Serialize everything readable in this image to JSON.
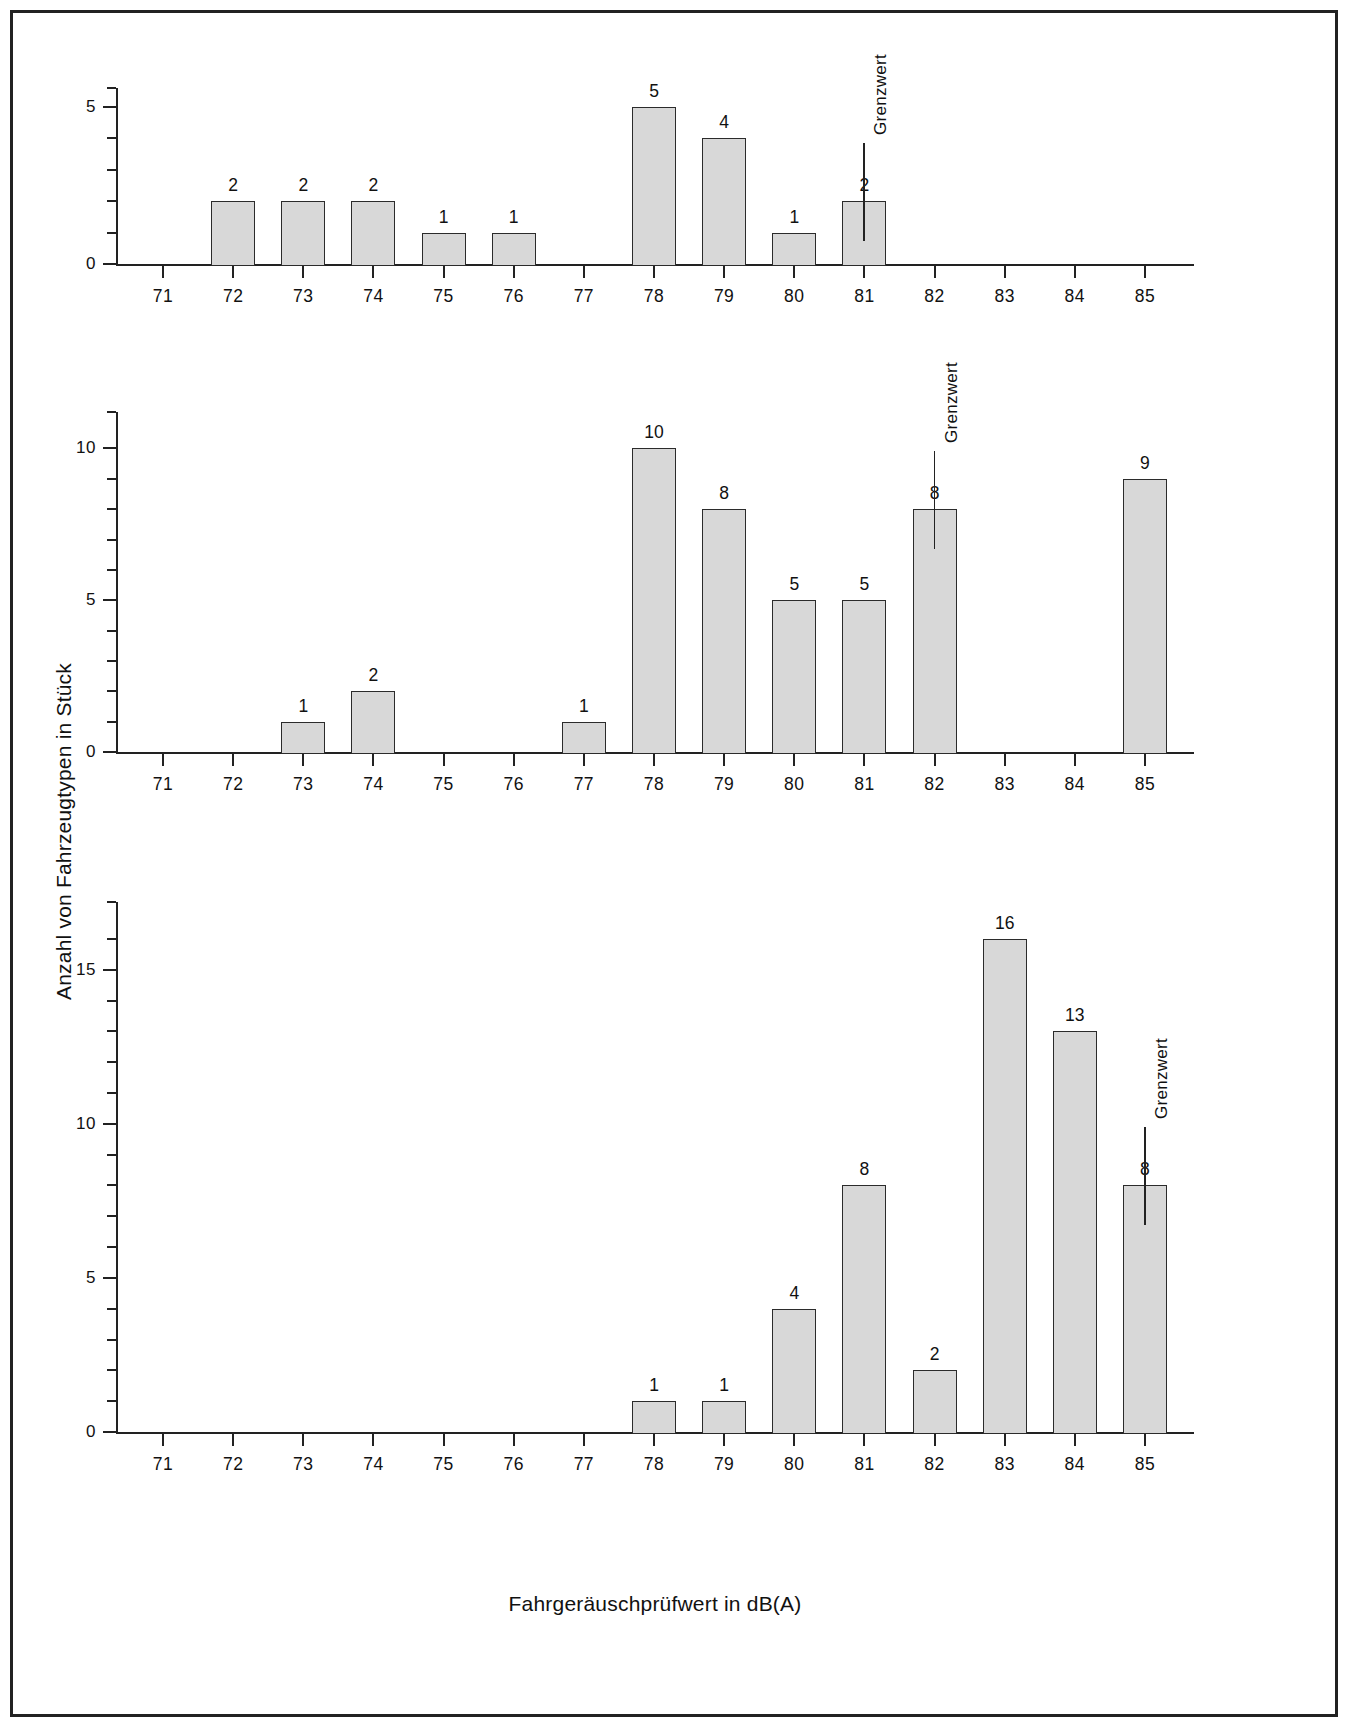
{
  "axis_titles": {
    "y": "Anzahl von Fahrzeugtypen in Stück",
    "x": "Fahrgeräuschprüfwert in dB(A)"
  },
  "colors": {
    "bar_fill": "#d8d8d8",
    "bar_stroke": "#2b2b2b",
    "axis": "#222222",
    "page_bg": "#ffffff"
  },
  "limit_label": "Grenzwert",
  "chart_data": [
    {
      "type": "bar",
      "id": "panel-1",
      "title": "≤ 3.5 t",
      "subtitle": "(20 Stck.)",
      "xlabel": "Fahrgeräuschprüfwert in dB(A)",
      "ylabel": "Anzahl von Fahrzeugtypen in Stück",
      "categories": [
        "71",
        "72",
        "73",
        "74",
        "75",
        "76",
        "77",
        "78",
        "79",
        "80",
        "81",
        "82",
        "83",
        "84",
        "85"
      ],
      "values": [
        0,
        2,
        2,
        2,
        1,
        1,
        0,
        5,
        4,
        1,
        2,
        0,
        0,
        0,
        0
      ],
      "bar_labels": [
        "",
        "2",
        "2",
        "2",
        "1",
        "1",
        "",
        "5",
        "4",
        "1",
        "2",
        "",
        "",
        "",
        ""
      ],
      "ylim": [
        0,
        5.6
      ],
      "ytick_major": [
        0,
        5
      ],
      "ytick_major_labels": [
        "0",
        "5"
      ],
      "ytick_minor": [
        1,
        2,
        3,
        4
      ],
      "grid": false,
      "legend": "none",
      "annotation": {
        "label": "Grenzwert",
        "category": "81",
        "value_top": 2
      }
    },
    {
      "type": "bar",
      "id": "panel-2",
      "title": "> 3.5 t",
      "subtitle": "(49 Stck.)",
      "xlabel": "Fahrgeräuschprüfwert in dB(A)",
      "ylabel": "Anzahl von Fahrzeugtypen in Stück",
      "categories": [
        "71",
        "72",
        "73",
        "74",
        "75",
        "76",
        "77",
        "78",
        "79",
        "80",
        "81",
        "82",
        "83",
        "84",
        "85"
      ],
      "values": [
        0,
        0,
        1,
        2,
        0,
        0,
        1,
        10,
        8,
        5,
        5,
        8,
        0,
        0,
        9
      ],
      "bar_labels": [
        "",
        "",
        "1",
        "2",
        "",
        "",
        "1",
        "10",
        "8",
        "5",
        "5",
        "8",
        "",
        "",
        "9"
      ],
      "ylim": [
        0,
        11.2
      ],
      "ytick_major": [
        0,
        5,
        10
      ],
      "ytick_major_labels": [
        "0",
        "5",
        "10"
      ],
      "ytick_minor": [
        1,
        2,
        3,
        4,
        6,
        7,
        8,
        9
      ],
      "grid": false,
      "legend": "none",
      "annotation": {
        "label": "Grenzwert",
        "category": "82",
        "value_top": 8
      }
    },
    {
      "type": "bar",
      "id": "panel-3",
      "title": "> 150 kW",
      "subtitle": "(55 Stck.)",
      "xlabel": "Fahrgeräuschprüfwert in dB(A)",
      "ylabel": "Anzahl von Fahrzeugtypen in Stück",
      "categories": [
        "71",
        "72",
        "73",
        "74",
        "75",
        "76",
        "77",
        "78",
        "79",
        "80",
        "81",
        "82",
        "83",
        "84",
        "85"
      ],
      "values": [
        0,
        0,
        0,
        0,
        0,
        0,
        0,
        1,
        1,
        4,
        8,
        2,
        16,
        13,
        8
      ],
      "bar_labels": [
        "",
        "",
        "",
        "",
        "",
        "",
        "",
        "1",
        "1",
        "4",
        "8",
        "2",
        "16",
        "13",
        "8"
      ],
      "ylim": [
        0,
        17.2
      ],
      "ytick_major": [
        0,
        5,
        10,
        15
      ],
      "ytick_major_labels": [
        "0",
        "5",
        "10",
        "15"
      ],
      "ytick_minor": [
        1,
        2,
        3,
        4,
        6,
        7,
        8,
        9,
        11,
        12,
        13,
        14,
        16
      ],
      "grid": false,
      "legend": "none",
      "annotation": {
        "label": "Grenzwert",
        "category": "85",
        "value_top": 8
      }
    }
  ]
}
